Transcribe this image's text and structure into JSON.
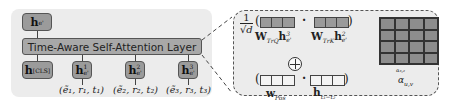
{
  "left": {
    "output_node": {
      "base": "h",
      "sub": "e'"
    },
    "layer_label": "Time-Aware Self-Attention Layer",
    "cls_node": {
      "base": "h",
      "sub": "[CLS]"
    },
    "token_nodes": [
      {
        "base": "h",
        "sup": "1",
        "sub": "e'"
      },
      {
        "base": "h",
        "sup": "2",
        "sub": "e'"
      },
      {
        "base": "h",
        "sup": "3",
        "sub": "e'"
      }
    ],
    "inputs": [
      "(ẽ₁, r₁, t₁)",
      "(ẽ₂, r₂, t₂)",
      "(ẽ₃, r₃, t₃)"
    ]
  },
  "right": {
    "scale": {
      "numerator": "1",
      "denominator": "√d"
    },
    "query_label": {
      "base": "W",
      "sub": "TrQ",
      "vec": "h",
      "vec_sup": "3",
      "vec_sub": "e'"
    },
    "key_label": {
      "base": "W",
      "sub": "TrK",
      "vec": "h",
      "vec_sup": "2",
      "vec_sub": "e'"
    },
    "pos_label": {
      "base": "w",
      "sub": "Pos"
    },
    "time_label": {
      "base": "h",
      "sub": "t₃−t₂"
    },
    "dot": "·",
    "open_paren": "(",
    "close_paren": ")",
    "cell_label": "α₃,₂",
    "matrix_label": "α_{u,v}",
    "matrix_label_base": "α",
    "matrix_label_sub": "u,v"
  }
}
